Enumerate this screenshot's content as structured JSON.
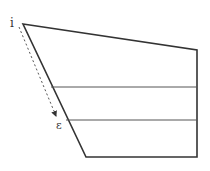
{
  "diagram": {
    "type": "geometric-figure",
    "colors": {
      "stroke": "#333333",
      "thin_stroke": "#555555",
      "dashed": "#555555",
      "background": "#ffffff"
    },
    "labels": {
      "start": "i",
      "end": "ε"
    },
    "shape": {
      "description": "Quadrilateral (trapezoid-like) divided by two horizontal lines",
      "vertices": [
        [
          23,
          24
        ],
        [
          197,
          50
        ],
        [
          197,
          157
        ],
        [
          86,
          157
        ]
      ]
    },
    "horizontal_lines": [
      {
        "y": 87,
        "x_start": 51,
        "x_end": 197
      },
      {
        "y": 120,
        "x_start": 66,
        "x_end": 197
      }
    ],
    "arrow": {
      "style": "dashed",
      "from": [
        19,
        27
      ],
      "to": [
        56,
        116
      ],
      "from_label": "i",
      "to_label": "ε"
    }
  }
}
